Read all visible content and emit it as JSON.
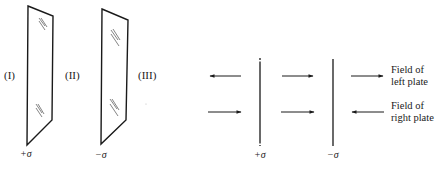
{
  "colors": {
    "ink": "#1a1a1a",
    "hatch": "#555555",
    "background": "#ffffff"
  },
  "perspective_view": {
    "regions": [
      {
        "label": "(I)"
      },
      {
        "label": "(II)"
      },
      {
        "label": "(III)"
      }
    ],
    "plates": [
      {
        "charge_label": "+σ"
      },
      {
        "charge_label": "−σ"
      }
    ]
  },
  "edge_view": {
    "plates": [
      {
        "charge_label": "+σ"
      },
      {
        "charge_label": "−σ"
      }
    ],
    "field_rows": [
      {
        "name": "left-plate-field",
        "directions": [
          "left",
          "right",
          "right"
        ]
      },
      {
        "name": "right-plate-field",
        "directions": [
          "right",
          "right",
          "left"
        ]
      }
    ],
    "legend": [
      {
        "line1": "Field of",
        "line2": "left plate"
      },
      {
        "line1": "Field of",
        "line2": "right plate"
      }
    ]
  }
}
